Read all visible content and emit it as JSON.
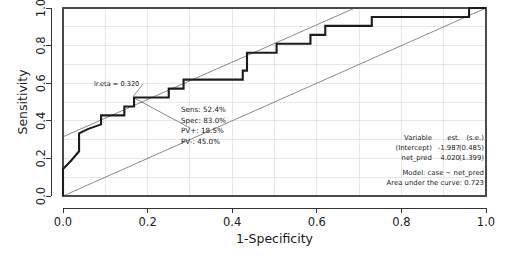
{
  "chart_data": {
    "type": "line",
    "title": "",
    "xlabel": "1-Specificity",
    "ylabel": "Sensitivity",
    "xlim": [
      0,
      1
    ],
    "ylim": [
      0,
      1
    ],
    "grid": true,
    "xticks": [
      "0.0",
      "0.2",
      "0.4",
      "0.6",
      "0.8",
      "1.0"
    ],
    "xtick_values": [
      0.0,
      0.2,
      0.4,
      0.6,
      0.8,
      1.0
    ],
    "yticks": [
      "0.0",
      "0.2",
      "0.4",
      "0.6",
      "0.8",
      "1.0"
    ],
    "ytick_values": [
      0.0,
      0.2,
      0.4,
      0.6,
      0.8,
      1.0
    ],
    "series": [
      {
        "name": "ROC curve",
        "points": [
          [
            0.0,
            0.0
          ],
          [
            0.0,
            0.143
          ],
          [
            0.02,
            0.19
          ],
          [
            0.038,
            0.238
          ],
          [
            0.038,
            0.333
          ],
          [
            0.06,
            0.357
          ],
          [
            0.09,
            0.381
          ],
          [
            0.09,
            0.429
          ],
          [
            0.145,
            0.429
          ],
          [
            0.145,
            0.476
          ],
          [
            0.168,
            0.476
          ],
          [
            0.168,
            0.524
          ],
          [
            0.25,
            0.524
          ],
          [
            0.25,
            0.571
          ],
          [
            0.285,
            0.571
          ],
          [
            0.285,
            0.619
          ],
          [
            0.425,
            0.619
          ],
          [
            0.425,
            0.667
          ],
          [
            0.435,
            0.667
          ],
          [
            0.435,
            0.762
          ],
          [
            0.505,
            0.762
          ],
          [
            0.505,
            0.81
          ],
          [
            0.585,
            0.81
          ],
          [
            0.585,
            0.857
          ],
          [
            0.62,
            0.857
          ],
          [
            0.62,
            0.905
          ],
          [
            0.73,
            0.905
          ],
          [
            0.73,
            0.952
          ],
          [
            0.96,
            0.952
          ],
          [
            0.96,
            1.0
          ],
          [
            1.0,
            1.0
          ]
        ]
      },
      {
        "name": "upper reference line",
        "points": [
          [
            0.0,
            0.315
          ],
          [
            0.69,
            1.0
          ]
        ]
      },
      {
        "name": "lower reference line",
        "points": [
          [
            0.0,
            0.0
          ],
          [
            1.0,
            1.0
          ]
        ]
      }
    ],
    "operating_point": {
      "x": 0.168,
      "y": 0.524,
      "eta_label": "lr.eta = 0.320",
      "stats": [
        "Sens: 52.4%",
        "Spec: 83.0%",
        "PV+: 18.5%",
        "PV-: 45.0%"
      ]
    },
    "legend": {
      "position": "bottom-right",
      "columns": [
        "Variable",
        "est.",
        "(s.e.)"
      ],
      "rows": [
        {
          "variable": "(Intercept)",
          "est": "-1.987",
          "se": "(0.485)"
        },
        {
          "variable": "net_pred",
          "est": "4.020",
          "se": "(1.399)"
        }
      ],
      "model_line": "Model:  case ~ net_pred",
      "auc_line": "Area under the curve: 0.723"
    }
  },
  "colors": {
    "curve": "#1c1c1c",
    "reference": "#6b6b6b",
    "grid": "#d8d8d8",
    "frame": "#4a4a4a",
    "background": "#ffffff"
  }
}
